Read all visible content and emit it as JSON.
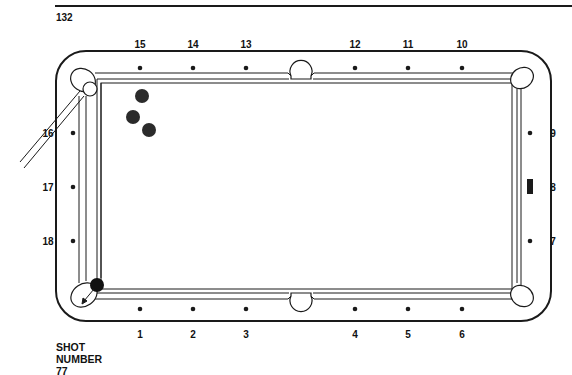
{
  "page": {
    "number": "132",
    "caption": {
      "line1": "SHOT",
      "line2": "NUMBER",
      "line3": "77"
    }
  },
  "diamond_labels": {
    "top": [
      {
        "label": "15",
        "x": 140
      },
      {
        "label": "14",
        "x": 193
      },
      {
        "label": "13",
        "x": 246
      },
      {
        "label": "12",
        "x": 355
      },
      {
        "label": "11",
        "x": 408
      },
      {
        "label": "10",
        "x": 462
      }
    ],
    "bottom": [
      {
        "label": "1",
        "x": 140
      },
      {
        "label": "2",
        "x": 193
      },
      {
        "label": "3",
        "x": 246
      },
      {
        "label": "4",
        "x": 355
      },
      {
        "label": "5",
        "x": 408
      },
      {
        "label": "6",
        "x": 462
      }
    ],
    "left": [
      {
        "label": "16",
        "y": 133
      },
      {
        "label": "17",
        "y": 187
      },
      {
        "label": "18",
        "y": 241
      }
    ],
    "right": [
      {
        "label": "9",
        "y": 133
      },
      {
        "label": "8",
        "y": 187
      },
      {
        "label": "7",
        "y": 241
      }
    ]
  },
  "balls": {
    "object_balls": [
      {
        "x": 142,
        "y": 96
      },
      {
        "x": 133,
        "y": 117
      },
      {
        "x": 149,
        "y": 130
      }
    ],
    "target_ball": {
      "x": 97,
      "y": 285
    },
    "cue_ball": {
      "x": 90,
      "y": 89
    }
  },
  "markers": {
    "right_rail_marker": "rectangle at diamond 8",
    "arrow": "cue-ball path arrow into lower-left pocket"
  },
  "colors": {
    "ink": "#1a1a1a",
    "ball": "#2b2b2b",
    "paper": "#ffffff"
  }
}
